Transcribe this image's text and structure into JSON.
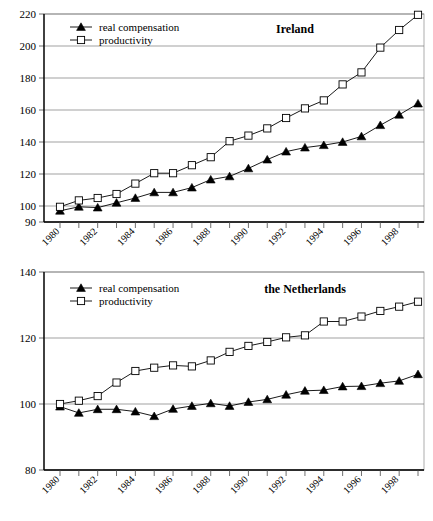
{
  "figure": {
    "charts": [
      {
        "id": "ireland",
        "title": "Ireland",
        "type": "line",
        "xlabel": "",
        "ylabel": "",
        "ylim": [
          90,
          220
        ],
        "yticks": [
          90,
          100,
          120,
          140,
          160,
          180,
          200,
          220
        ],
        "grid": true,
        "legend_position": "top-left",
        "x": [
          1980,
          1981,
          1982,
          1983,
          1984,
          1985,
          1986,
          1987,
          1988,
          1989,
          1990,
          1991,
          1992,
          1993,
          1994,
          1995,
          1996,
          1997,
          1998,
          1999
        ],
        "xticklabels": [
          "1980",
          "1982",
          "1984",
          "1986",
          "1988",
          "1990",
          "1992",
          "1994",
          "1996",
          "1998"
        ],
        "series": [
          {
            "name": "real compensation",
            "marker": "filled-triangle",
            "values": [
              97.0,
              99.5,
              99.0,
              102.0,
              105.0,
              108.5,
              108.5,
              111.5,
              116.5,
              118.5,
              123.5,
              129.0,
              134.0,
              136.5,
              138.0,
              140.0,
              143.5,
              150.5,
              157.0,
              164.0
            ]
          },
          {
            "name": "productivity",
            "marker": "open-square",
            "values": [
              99.5,
              103.5,
              105.0,
              107.5,
              114.0,
              120.5,
              120.5,
              125.5,
              130.5,
              140.5,
              144.0,
              148.5,
              155.0,
              161.0,
              166.0,
              176.0,
              183.5,
              199.0,
              210.0,
              219.5
            ]
          }
        ]
      },
      {
        "id": "netherlands",
        "title": "the Netherlands",
        "type": "line",
        "xlabel": "",
        "ylabel": "",
        "ylim": [
          80,
          140
        ],
        "yticks": [
          80,
          100,
          120,
          140
        ],
        "grid": true,
        "legend_position": "top-left",
        "x": [
          1980,
          1981,
          1982,
          1983,
          1984,
          1985,
          1986,
          1987,
          1988,
          1989,
          1990,
          1991,
          1992,
          1993,
          1994,
          1995,
          1996,
          1997,
          1998,
          1999
        ],
        "xticklabels": [
          "1980",
          "1982",
          "1984",
          "1986",
          "1988",
          "1990",
          "1992",
          "1994",
          "1996",
          "1998"
        ],
        "series": [
          {
            "name": "real compensation",
            "marker": "filled-triangle",
            "values": [
              99.2,
              97.3,
              98.4,
              98.4,
              97.7,
              96.3,
              98.5,
              99.4,
              100.2,
              99.4,
              100.6,
              101.4,
              102.8,
              104.0,
              104.2,
              105.3,
              105.4,
              106.3,
              107.0,
              109.0
            ]
          },
          {
            "name": "productivity",
            "marker": "open-square",
            "values": [
              100.0,
              101.0,
              102.4,
              106.5,
              110.0,
              111.0,
              111.7,
              111.4,
              113.2,
              115.8,
              117.6,
              118.8,
              120.2,
              120.8,
              125.0,
              125.0,
              126.5,
              128.2,
              129.5,
              131.0
            ]
          }
        ]
      }
    ]
  },
  "chart_data": [
    {
      "type": "line",
      "title": "Ireland",
      "xlabel": "",
      "ylabel": "",
      "ylim": [
        90,
        220
      ],
      "xlim": [
        1980,
        1999
      ],
      "grid": true,
      "legend_position": "top-left",
      "x": [
        1980,
        1981,
        1982,
        1983,
        1984,
        1985,
        1986,
        1987,
        1988,
        1989,
        1990,
        1991,
        1992,
        1993,
        1994,
        1995,
        1996,
        1997,
        1998,
        1999
      ],
      "series": [
        {
          "name": "real compensation",
          "values": [
            97.0,
            99.5,
            99.0,
            102.0,
            105.0,
            108.5,
            108.5,
            111.5,
            116.5,
            118.5,
            123.5,
            129.0,
            134.0,
            136.5,
            138.0,
            140.0,
            143.5,
            150.5,
            157.0,
            164.0
          ]
        },
        {
          "name": "productivity",
          "values": [
            99.5,
            103.5,
            105.0,
            107.5,
            114.0,
            120.5,
            120.5,
            125.5,
            130.5,
            140.5,
            144.0,
            148.5,
            155.0,
            161.0,
            166.0,
            176.0,
            183.5,
            199.0,
            210.0,
            219.5
          ]
        }
      ]
    },
    {
      "type": "line",
      "title": "the Netherlands",
      "xlabel": "",
      "ylabel": "",
      "ylim": [
        80,
        140
      ],
      "xlim": [
        1980,
        1999
      ],
      "grid": true,
      "legend_position": "top-left",
      "x": [
        1980,
        1981,
        1982,
        1983,
        1984,
        1985,
        1986,
        1987,
        1988,
        1989,
        1990,
        1991,
        1992,
        1993,
        1994,
        1995,
        1996,
        1997,
        1998,
        1999
      ],
      "series": [
        {
          "name": "real compensation",
          "values": [
            99.2,
            97.3,
            98.4,
            98.4,
            97.7,
            96.3,
            98.5,
            99.4,
            100.2,
            99.4,
            100.6,
            101.4,
            102.8,
            104.0,
            104.2,
            105.3,
            105.4,
            106.3,
            107.0,
            109.0
          ]
        },
        {
          "name": "productivity",
          "values": [
            100.0,
            101.0,
            102.4,
            106.5,
            110.0,
            111.0,
            111.7,
            111.4,
            113.2,
            115.8,
            117.6,
            118.8,
            120.2,
            120.8,
            125.0,
            125.0,
            126.5,
            128.2,
            129.5,
            131.0
          ]
        }
      ]
    }
  ]
}
